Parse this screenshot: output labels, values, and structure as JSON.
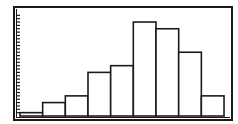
{
  "chart_data": {
    "type": "bar",
    "subtype": "histogram",
    "title": "",
    "xlabel": "",
    "ylabel": "",
    "categories": [
      "bin1",
      "bin2",
      "bin3",
      "bin4",
      "bin5",
      "bin6",
      "bin7",
      "bin8",
      "bin9"
    ],
    "values": [
      1,
      4,
      6,
      13,
      15,
      28,
      26,
      19,
      6
    ],
    "ylim": [
      0,
      31
    ],
    "y_tick_step": 1,
    "grid": false,
    "legend": null,
    "colors": {
      "stroke": "#1a1a1a",
      "fill": "#ffffff",
      "background": "#ffffff"
    }
  }
}
